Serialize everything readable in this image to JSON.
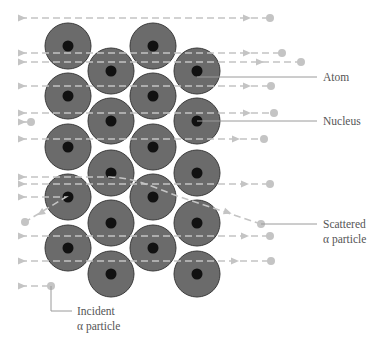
{
  "diagram": {
    "colors": {
      "atom": "#6b6b6b",
      "nucleus": "#111111",
      "particle_path": "#c4c4c4",
      "label": "#555555",
      "leader": "#9a9a9a"
    },
    "atom_radius": 23,
    "nucleus_radius": 5.5,
    "atoms": [
      {
        "x": 68,
        "y": 46
      },
      {
        "x": 68,
        "y": 96
      },
      {
        "x": 68,
        "y": 147
      },
      {
        "x": 68,
        "y": 197
      },
      {
        "x": 68,
        "y": 248
      },
      {
        "x": 111,
        "y": 71
      },
      {
        "x": 111,
        "y": 121
      },
      {
        "x": 111,
        "y": 173
      },
      {
        "x": 111,
        "y": 223
      },
      {
        "x": 111,
        "y": 274
      },
      {
        "x": 153,
        "y": 46
      },
      {
        "x": 153,
        "y": 96
      },
      {
        "x": 153,
        "y": 147
      },
      {
        "x": 153,
        "y": 197
      },
      {
        "x": 153,
        "y": 248
      },
      {
        "x": 197,
        "y": 71
      },
      {
        "x": 197,
        "y": 121
      },
      {
        "x": 197,
        "y": 173
      },
      {
        "x": 197,
        "y": 223
      },
      {
        "x": 197,
        "y": 274
      }
    ],
    "particle_paths": [
      {
        "type": "straight",
        "y": 18,
        "x_start": 20,
        "x_end": 270,
        "arrows": [
          22,
          247
        ]
      },
      {
        "type": "straight",
        "y": 53,
        "x_start": 20,
        "x_end": 282,
        "arrows": [
          22,
          247
        ]
      },
      {
        "type": "straight",
        "y": 62,
        "x_start": 20,
        "x_end": 301,
        "arrows": [
          22,
          260
        ]
      },
      {
        "type": "straight",
        "y": 86,
        "x_start": 20,
        "x_end": 271,
        "arrows": [
          22,
          247
        ]
      },
      {
        "type": "straight",
        "y": 113,
        "x_start": 20,
        "x_end": 274,
        "arrows": [
          22,
          247
        ]
      },
      {
        "type": "straight",
        "y": 122,
        "x_start": 20,
        "x_end": 31,
        "arrows": [
          22
        ]
      },
      {
        "type": "straight",
        "y": 139,
        "x_start": 20,
        "x_end": 264,
        "arrows": [
          22,
          236
        ]
      },
      {
        "type": "straight",
        "y": 184,
        "x_start": 20,
        "x_end": 270,
        "arrows": [
          22,
          245
        ]
      },
      {
        "type": "straight",
        "y": 236,
        "x_start": 20,
        "x_end": 270,
        "arrows": [
          22,
          245
        ]
      },
      {
        "type": "straight",
        "y": 261,
        "x_start": 20,
        "x_end": 271,
        "arrows": [
          22,
          235
        ]
      },
      {
        "type": "straight",
        "y": 286,
        "x_start": 20,
        "x_end": 51,
        "arrows": [
          22
        ]
      },
      {
        "type": "scattered",
        "d": "M20,177 L110,177 C135,178 150,186 180,197 L261,224",
        "end": {
          "x": 261,
          "y": 224
        }
      },
      {
        "type": "reflected",
        "d": "M20,197 L66,197 L25,222",
        "end": {
          "x": 25,
          "y": 222
        }
      }
    ],
    "labels": {
      "atom": {
        "text": "Atom",
        "x": 323,
        "y": 81,
        "leader": "M197,77 L317,77"
      },
      "nucleus": {
        "text": "Nucleus",
        "x": 323,
        "y": 125,
        "leader": "M197,121 L317,121"
      },
      "scattered_line1": {
        "text": "Scattered",
        "x": 323,
        "y": 228
      },
      "scattered_line2": {
        "text": "α particle",
        "x": 323,
        "y": 243
      },
      "scattered_leader": "M261,224 L317,224",
      "incident_line1": {
        "text": "Incident",
        "x": 77,
        "y": 315
      },
      "incident_line2": {
        "text": "α particle",
        "x": 77,
        "y": 330
      },
      "incident_leader": "M51,286 L51,311 L72,311"
    }
  }
}
